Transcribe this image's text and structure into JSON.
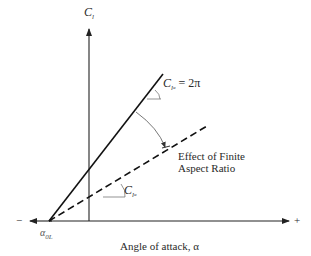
{
  "diagram": {
    "y_axis_label": {
      "main": "C",
      "sub": "l"
    },
    "x_axis_label": "Angle of attack, α",
    "x_axis_neg": "−",
    "x_axis_pos": "+",
    "zero_lift_angle": {
      "main": "α",
      "sub": "0L"
    },
    "airfoil_slope_label": {
      "main": "C",
      "sub": "l",
      "subsub": "α",
      "rhs": " = 2π"
    },
    "wing_slope_label": {
      "main": "C",
      "sub": "l",
      "subsub": "α"
    },
    "annotation_line1": "Effect of Finite",
    "annotation_line2": "Aspect Ratio",
    "lines": [
      {
        "name": "infinite-wing-lift-curve",
        "style": "solid"
      },
      {
        "name": "finite-wing-lift-curve",
        "style": "dashed"
      }
    ],
    "colors": {
      "ink": "#222222",
      "arc": "#555555",
      "background": "#ffffff"
    }
  }
}
